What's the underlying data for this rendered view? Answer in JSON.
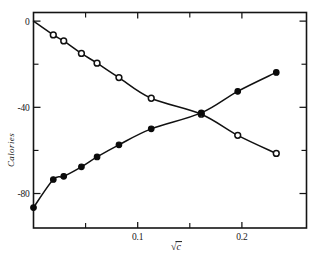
{
  "chart_data": {
    "type": "scatter",
    "title": "",
    "subtitle": "",
    "xlabel": "√c",
    "ylabel": "Calories",
    "xlim": [
      0.0,
      0.262
    ],
    "ylim": [
      -96,
      4
    ],
    "grid": false,
    "legend": "none",
    "x_ticks_major": [
      0.1,
      0.2
    ],
    "x_ticks_major_labels": [
      "0.1",
      "0.2"
    ],
    "x_ticks_minor": [
      0.05,
      0.15
    ],
    "y_ticks_major": [
      0,
      -40,
      -80
    ],
    "y_ticks_major_labels": [
      "0",
      "-40",
      "-80"
    ],
    "y_ticks_minor": [
      -20,
      -60
    ],
    "series": [
      {
        "name": "descending-open-circles",
        "marker": "open-circle",
        "marker_color": "#ffffff",
        "line_color": "#111111",
        "x": [
          0.0,
          0.019,
          0.029,
          0.046,
          0.061,
          0.082,
          0.113,
          0.161,
          0.196,
          0.233
        ],
        "y": [
          0.0,
          -6.4,
          -9.2,
          -15.0,
          -19.5,
          -26.2,
          -35.8,
          -43.2,
          -53.0,
          -61.4
        ]
      },
      {
        "name": "ascending-filled-circles",
        "marker": "filled-circle",
        "marker_color": "#0b0b0b",
        "line_color": "#111111",
        "x": [
          0.0,
          0.019,
          0.029,
          0.046,
          0.061,
          0.082,
          0.113,
          0.161,
          0.196,
          0.233
        ],
        "y": [
          -86.5,
          -73.5,
          -72.0,
          -67.6,
          -63.0,
          -57.4,
          -50.0,
          -42.6,
          -32.6,
          -23.8
        ]
      }
    ],
    "annotations": [
      {
        "kind": "curve-break",
        "series": "descending-open-circles",
        "x": 0.211,
        "note": "short gap in drawn line"
      },
      {
        "kind": "crossing",
        "x": 0.161,
        "y": -42.8,
        "note": "the two curves intersect"
      }
    ]
  },
  "figure": {
    "background_color": "#ffffff",
    "axis_color": "#141414",
    "frame": "box-with-inward-ticks"
  }
}
